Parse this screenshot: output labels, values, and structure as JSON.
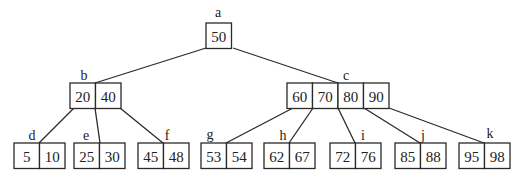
{
  "diagram": {
    "type": "B-tree",
    "nodes": [
      {
        "id": "a",
        "label": "a",
        "keys": [
          "50"
        ],
        "x": 206,
        "y": 23,
        "labelPos": [
          218,
          12
        ],
        "level": 0
      },
      {
        "id": "b",
        "label": "b",
        "keys": [
          "20",
          "40"
        ],
        "x": 70,
        "y": 83,
        "labelPos": [
          84,
          75
        ],
        "level": 1
      },
      {
        "id": "c",
        "label": "c",
        "keys": [
          "60",
          "70",
          "80",
          "90"
        ],
        "x": 287,
        "y": 83,
        "labelPos": [
          346,
          75
        ],
        "level": 1
      },
      {
        "id": "d",
        "label": "d",
        "keys": [
          "5",
          "10"
        ],
        "x": 14,
        "y": 143,
        "labelPos": [
          32,
          135
        ],
        "level": 2
      },
      {
        "id": "e",
        "label": "e",
        "keys": [
          "25",
          "30"
        ],
        "x": 74,
        "y": 143,
        "labelPos": [
          86,
          135
        ],
        "level": 2
      },
      {
        "id": "f",
        "label": "f",
        "keys": [
          "45",
          "48"
        ],
        "x": 138,
        "y": 143,
        "labelPos": [
          167,
          135
        ],
        "level": 2
      },
      {
        "id": "g",
        "label": "g",
        "keys": [
          "53",
          "54"
        ],
        "x": 201,
        "y": 143,
        "labelPos": [
          210,
          134
        ],
        "level": 2
      },
      {
        "id": "h",
        "label": "h",
        "keys": [
          "62",
          "67"
        ],
        "x": 264,
        "y": 143,
        "labelPos": [
          283,
          135
        ],
        "level": 2
      },
      {
        "id": "i",
        "label": "i",
        "keys": [
          "72",
          "76"
        ],
        "x": 330,
        "y": 143,
        "labelPos": [
          363,
          135
        ],
        "level": 2
      },
      {
        "id": "j",
        "label": "j",
        "keys": [
          "85",
          "88"
        ],
        "x": 395,
        "y": 143,
        "labelPos": [
          423,
          135
        ],
        "level": 2
      },
      {
        "id": "k",
        "label": "k",
        "keys": [
          "95",
          "98"
        ],
        "x": 459,
        "y": 143,
        "labelPos": [
          490,
          133
        ],
        "level": 2
      }
    ],
    "edges": [
      {
        "from": "a",
        "to": "b",
        "x1": 206,
        "y1": 48,
        "x2": 95,
        "y2": 83
      },
      {
        "from": "a",
        "to": "c",
        "x1": 233,
        "y1": 48,
        "x2": 338,
        "y2": 83
      },
      {
        "from": "b",
        "to": "d",
        "x1": 74,
        "y1": 108,
        "x2": 39,
        "y2": 143
      },
      {
        "from": "b",
        "to": "e",
        "x1": 95,
        "y1": 108,
        "x2": 100,
        "y2": 143
      },
      {
        "from": "b",
        "to": "f",
        "x1": 120,
        "y1": 108,
        "x2": 163,
        "y2": 143
      },
      {
        "from": "c",
        "to": "g",
        "x1": 293,
        "y1": 108,
        "x2": 226,
        "y2": 143
      },
      {
        "from": "c",
        "to": "h",
        "x1": 313,
        "y1": 108,
        "x2": 289,
        "y2": 143
      },
      {
        "from": "c",
        "to": "i",
        "x1": 338,
        "y1": 108,
        "x2": 355,
        "y2": 143
      },
      {
        "from": "c",
        "to": "j",
        "x1": 364,
        "y1": 108,
        "x2": 420,
        "y2": 143
      },
      {
        "from": "c",
        "to": "k",
        "x1": 389,
        "y1": 108,
        "x2": 484,
        "y2": 143
      }
    ],
    "cellWidth": 25.5,
    "cellHeight": 25.5,
    "colors": {
      "stroke": "#2a2a2a",
      "text": "#222222",
      "background": "#ffffff"
    }
  }
}
